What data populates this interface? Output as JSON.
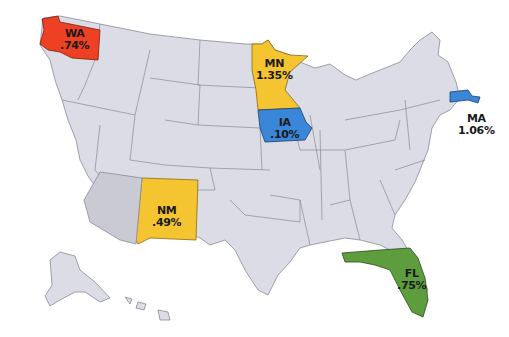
{
  "map": {
    "title": "United States map of highlighted states with percentages",
    "base_color": "#dcdce6",
    "border_color": "#8a8a96",
    "highlighted_states": [
      {
        "code": "WA",
        "value": ".74%",
        "color": "#ee4022"
      },
      {
        "code": "MN",
        "value": "1.35%",
        "color": "#f5c531"
      },
      {
        "code": "IA",
        "value": ".10%",
        "color": "#3a86d8"
      },
      {
        "code": "MA",
        "value": "1.06%",
        "color": "#3a86d8"
      },
      {
        "code": "NM",
        "value": ".49%",
        "color": "#f5c531"
      },
      {
        "code": "FL",
        "value": ".75%",
        "color": "#5e9d3e"
      }
    ]
  }
}
